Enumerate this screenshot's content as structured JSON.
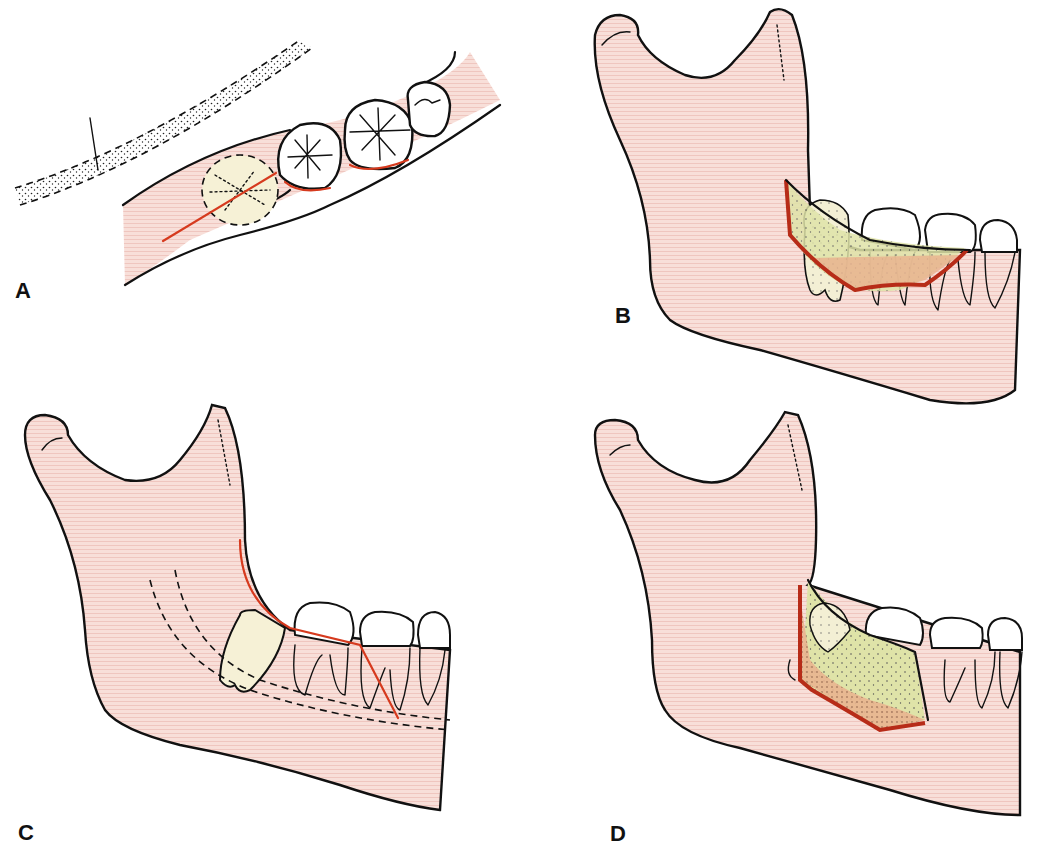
{
  "figure": {
    "panels": [
      {
        "id": "A",
        "label": "A",
        "view": "occlusal view of lower posterior teeth with impacted third molar (dashed outline) and incision line"
      },
      {
        "id": "B",
        "label": "B",
        "view": "lateral mandible with buccal flap outlined over impacted third molar"
      },
      {
        "id": "C",
        "label": "C",
        "view": "lateral mandible showing incision along ramus and distal to second molar with mandibular canal (dashed)"
      },
      {
        "id": "D",
        "label": "D",
        "view": "lateral mandible with full-thickness flap reflected exposing impacted tooth"
      }
    ]
  },
  "colors": {
    "bone_fill": "#f6d9d3",
    "bone_stripe": "#efc9c2",
    "outline": "#111111",
    "incision_red": "#d63a1e",
    "flap_green": "#dfe3a8",
    "flap_orange": "#e9b48f",
    "impacted_tooth": "#f6f1d6",
    "tooth_white": "#ffffff"
  }
}
